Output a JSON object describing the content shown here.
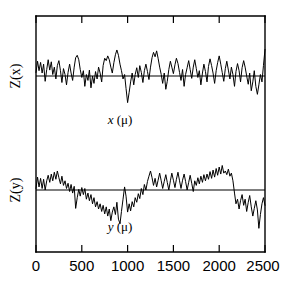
{
  "chart_data": {
    "type": "line",
    "title": "",
    "subtitle": "",
    "xlabel": "",
    "ylabel": "",
    "grid": false,
    "legend": "none",
    "panel_layout": "two stacked panels sharing one x-axis inside a single open frame",
    "x_axis": {
      "label_upper_panel": "x (μ)",
      "label_lower_panel": "y (μ)",
      "units": "μ",
      "min": 0,
      "max": 2500,
      "ticks": [
        0,
        500,
        1000,
        1500,
        2000,
        2500
      ],
      "tick_labels": [
        "0",
        "500",
        "1000",
        "1500",
        "2000",
        "2500"
      ],
      "tick_direction": "inward",
      "ticks_on": [
        "top",
        "bottom"
      ]
    },
    "y_axis": {
      "labels": [
        "Z(x)",
        "Z(y)"
      ],
      "tick_labels": [],
      "ticks": [],
      "note": "vertical axes unlabeled; each panel drawn about a horizontal zero baseline"
    },
    "panels": [
      {
        "id": "upper",
        "ylabel": "Z(x)",
        "inline_xlabel": "x (μ)",
        "baseline": 0,
        "ylim": [
          -1.15,
          1.15
        ],
        "x": [
          0,
          17,
          33,
          50,
          67,
          83,
          100,
          117,
          133,
          150,
          167,
          183,
          200,
          217,
          233,
          250,
          267,
          283,
          300,
          317,
          333,
          350,
          367,
          383,
          400,
          417,
          433,
          450,
          467,
          483,
          500,
          517,
          533,
          550,
          567,
          583,
          600,
          617,
          633,
          650,
          667,
          683,
          700,
          717,
          733,
          750,
          767,
          783,
          800,
          817,
          833,
          850,
          867,
          883,
          900,
          917,
          933,
          950,
          967,
          983,
          1000,
          1017,
          1033,
          1050,
          1067,
          1083,
          1100,
          1117,
          1133,
          1150,
          1167,
          1183,
          1200,
          1217,
          1233,
          1250,
          1267,
          1283,
          1300,
          1317,
          1333,
          1350,
          1367,
          1383,
          1400,
          1417,
          1433,
          1450,
          1467,
          1483,
          1500,
          1517,
          1533,
          1550,
          1567,
          1583,
          1600,
          1617,
          1633,
          1650,
          1667,
          1683,
          1700,
          1717,
          1733,
          1750,
          1767,
          1783,
          1800,
          1817,
          1833,
          1850,
          1867,
          1883,
          1900,
          1917,
          1933,
          1950,
          1967,
          1983,
          2000,
          2017,
          2033,
          2050,
          2067,
          2083,
          2100,
          2117,
          2133,
          2150,
          2167,
          2183,
          2200,
          2217,
          2233,
          2250,
          2267,
          2283,
          2300,
          2317,
          2333,
          2350,
          2367,
          2383,
          2400,
          2417,
          2433,
          2450,
          2467,
          2483,
          2500
        ],
        "values": [
          0.12,
          0.5,
          0.18,
          0.46,
          0.1,
          0.4,
          -0.18,
          0.22,
          0.55,
          0.2,
          0.48,
          0.05,
          0.3,
          -0.1,
          0.35,
          0.52,
          0.18,
          -0.22,
          0.25,
          0.05,
          -0.3,
          0.12,
          0.4,
          0.1,
          -0.15,
          0.3,
          0.62,
          0.7,
          0.55,
          0.22,
          -0.05,
          0.18,
          -0.35,
          0.05,
          -0.15,
          0.2,
          -0.4,
          0.0,
          -0.25,
          0.15,
          -0.1,
          0.3,
          0.1,
          -0.2,
          0.35,
          0.6,
          0.52,
          0.68,
          0.55,
          0.3,
          0.1,
          0.45,
          0.72,
          0.88,
          0.7,
          0.4,
          0.18,
          -0.1,
          0.05,
          -0.42,
          -0.9,
          -0.55,
          -0.2,
          0.1,
          -0.3,
          0.05,
          0.28,
          -0.05,
          0.35,
          0.12,
          -0.22,
          0.18,
          0.4,
          0.15,
          -0.12,
          0.3,
          0.62,
          0.8,
          0.65,
          0.85,
          0.6,
          0.3,
          0.05,
          -0.25,
          0.1,
          -0.45,
          -0.18,
          0.22,
          0.5,
          0.3,
          0.08,
          0.38,
          0.6,
          0.42,
          0.12,
          -0.15,
          0.22,
          -0.35,
          0.05,
          0.28,
          0.52,
          0.22,
          -0.08,
          0.3,
          0.55,
          0.25,
          -0.05,
          0.18,
          -0.3,
          0.1,
          0.4,
          0.15,
          -0.2,
          0.32,
          0.58,
          0.35,
          0.1,
          -0.25,
          0.18,
          0.45,
          0.68,
          0.4,
          0.12,
          -0.18,
          0.25,
          0.5,
          0.2,
          -0.1,
          0.3,
          0.05,
          -0.35,
          0.15,
          0.42,
          0.18,
          -0.2,
          0.28,
          0.52,
          0.3,
          0.0,
          -0.28,
          0.1,
          -0.5,
          -0.2,
          0.18,
          -0.35,
          -0.62,
          -0.3,
          0.05,
          -0.2,
          0.35,
          0.9,
          1.05
        ]
      },
      {
        "id": "lower",
        "ylabel": "Z(y)",
        "inline_xlabel": "y (μ)",
        "baseline": 0,
        "ylim": [
          -1.5,
          1.2
        ],
        "x": [
          0,
          17,
          33,
          50,
          67,
          83,
          100,
          117,
          133,
          150,
          167,
          183,
          200,
          217,
          233,
          250,
          267,
          283,
          300,
          317,
          333,
          350,
          367,
          383,
          400,
          417,
          433,
          450,
          467,
          483,
          500,
          517,
          533,
          550,
          567,
          583,
          600,
          617,
          633,
          650,
          667,
          683,
          700,
          717,
          733,
          750,
          767,
          783,
          800,
          817,
          833,
          850,
          867,
          883,
          900,
          917,
          933,
          950,
          967,
          983,
          1000,
          1017,
          1033,
          1050,
          1067,
          1083,
          1100,
          1117,
          1133,
          1150,
          1167,
          1183,
          1200,
          1217,
          1233,
          1250,
          1267,
          1283,
          1300,
          1317,
          1333,
          1350,
          1367,
          1383,
          1400,
          1417,
          1433,
          1450,
          1467,
          1483,
          1500,
          1517,
          1533,
          1550,
          1567,
          1583,
          1600,
          1617,
          1633,
          1650,
          1667,
          1683,
          1700,
          1717,
          1733,
          1750,
          1767,
          1783,
          1800,
          1817,
          1833,
          1850,
          1867,
          1883,
          1900,
          1917,
          1933,
          1950,
          1967,
          1983,
          2000,
          2017,
          2033,
          2050,
          2067,
          2083,
          2100,
          2117,
          2133,
          2150,
          2167,
          2183,
          2200,
          2217,
          2233,
          2250,
          2267,
          2283,
          2300,
          2317,
          2333,
          2350,
          2367,
          2383,
          2400,
          2417,
          2433,
          2450,
          2467,
          2483,
          2500
        ],
        "values": [
          0.05,
          0.42,
          0.1,
          0.38,
          0.05,
          0.35,
          0.0,
          0.3,
          0.48,
          0.25,
          0.52,
          0.3,
          0.58,
          0.35,
          0.62,
          0.4,
          0.2,
          0.45,
          0.15,
          0.3,
          0.05,
          0.22,
          -0.05,
          0.18,
          -0.1,
          0.12,
          -0.6,
          -0.25,
          0.02,
          -0.2,
          0.08,
          -0.15,
          0.05,
          -0.3,
          -0.1,
          -0.35,
          -0.15,
          -0.45,
          -0.25,
          -0.55,
          -0.38,
          -0.62,
          -0.45,
          -0.7,
          -0.5,
          -0.78,
          -0.55,
          -0.85,
          -0.62,
          -1.0,
          -0.72,
          -0.55,
          -0.8,
          -0.4,
          -0.95,
          -1.1,
          -0.7,
          -0.3,
          0.1,
          -0.2,
          -0.72,
          -0.45,
          -0.68,
          -0.38,
          -0.55,
          -0.25,
          -0.4,
          -0.12,
          -0.28,
          0.05,
          -0.15,
          0.18,
          0.0,
          0.28,
          0.45,
          0.62,
          0.4,
          0.15,
          0.38,
          0.1,
          0.32,
          0.55,
          0.3,
          0.05,
          0.28,
          0.5,
          0.25,
          0.0,
          0.3,
          0.55,
          0.32,
          0.08,
          0.35,
          0.58,
          0.3,
          0.05,
          0.32,
          0.52,
          0.28,
          0.0,
          0.25,
          0.48,
          0.22,
          -0.05,
          0.3,
          0.15,
          0.4,
          0.2,
          0.45,
          0.25,
          0.5,
          0.3,
          0.52,
          0.35,
          0.6,
          0.38,
          0.65,
          0.42,
          0.7,
          0.48,
          0.75,
          0.52,
          0.8,
          0.55,
          0.62,
          0.5,
          0.68,
          0.45,
          0.55,
          0.3,
          -0.1,
          -0.45,
          -0.3,
          -0.62,
          -0.35,
          -0.15,
          -0.5,
          -0.3,
          -0.7,
          -0.4,
          -0.18,
          -0.55,
          -0.85,
          -0.6,
          -0.35,
          -0.65,
          -1.25,
          -0.8,
          -0.45,
          -0.25,
          -0.5,
          -0.3,
          -0.55,
          -0.35
        ]
      }
    ]
  },
  "figure": {
    "upper_panel": {
      "y_axis_label": "Z(x)",
      "inline_x_label_var": "x",
      "inline_x_label_units": "(μ)"
    },
    "lower_panel": {
      "y_axis_label": "Z(y)",
      "inline_x_label_var": "y",
      "inline_x_label_units": "(μ)"
    },
    "x_tick_labels": [
      "0",
      "500",
      "1000",
      "1500",
      "2000",
      "2500"
    ],
    "colors": {
      "trace": "#000000",
      "frame": "#000000",
      "background": "#ffffff"
    }
  }
}
